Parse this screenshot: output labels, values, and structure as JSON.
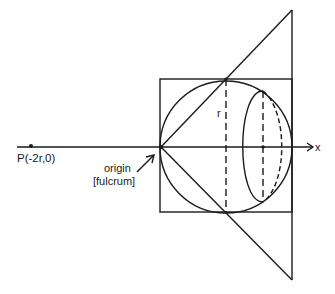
{
  "diagram": {
    "labels": {
      "point_p": "P(-2r,0)",
      "origin_line1": "origin",
      "origin_line2": "[fulcrum]",
      "radius": "r",
      "x_axis": "x"
    },
    "colors": {
      "stroke": "#1a1a1a",
      "background": "#ffffff"
    },
    "elements": [
      "x-axis",
      "point-p",
      "square",
      "circle",
      "cone-triangle",
      "radius-dashed-line",
      "ellipse-cross-section",
      "origin-arrow"
    ]
  }
}
